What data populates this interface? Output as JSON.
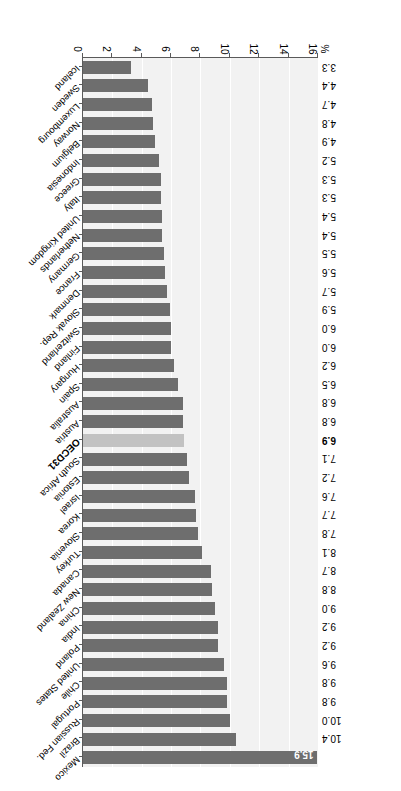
{
  "chart_data": {
    "type": "bar",
    "orientation": "vertical-bars-rotated",
    "title": "",
    "xlabel": "",
    "ylabel": "%",
    "unit_label": "%",
    "ylim": [
      0,
      16
    ],
    "tick_labels": [
      "0",
      "2",
      "4",
      "6",
      "8",
      "10",
      "12",
      "14",
      "16"
    ],
    "tick_values": [
      0,
      2,
      4,
      6,
      8,
      10,
      12,
      14,
      16
    ],
    "grid": true,
    "legend": "none",
    "highlight_category": "OECD31",
    "colors": {
      "bar": "#6e6e6e",
      "highlight_bar": "#c2c2c2",
      "plot_background": "#f2f2f2",
      "gridline": "#ffffff",
      "axis": "#5a5a5a",
      "text": "#000000"
    },
    "categories": [
      "Mexico",
      "Brazil",
      "Russian Fed.",
      "Portugal",
      "Chile",
      "United States",
      "Poland",
      "India",
      "China",
      "New Zealand",
      "Canada",
      "Turkey",
      "Slovenia",
      "Korea",
      "Israel",
      "Estonia",
      "South Africa",
      "OECD31",
      "Austria",
      "Australia",
      "Spain",
      "Hungary",
      "Finland",
      "Switzerland",
      "Slovak Rep.",
      "Denmark",
      "France",
      "Germany",
      "Netherlands",
      "United Kingdom",
      "Italy",
      "Greece",
      "Indonesia",
      "Belgium",
      "Norway",
      "Luxembourg",
      "Sweden",
      "Iceland"
    ],
    "values": [
      15.9,
      10.4,
      10.0,
      9.8,
      9.8,
      9.6,
      9.2,
      9.2,
      9.0,
      8.8,
      8.7,
      8.1,
      7.8,
      7.7,
      7.6,
      7.2,
      7.1,
      6.9,
      6.8,
      6.8,
      6.5,
      6.2,
      6.0,
      6.0,
      5.9,
      5.7,
      5.6,
      5.5,
      5.4,
      5.4,
      5.3,
      5.3,
      5.2,
      4.9,
      4.8,
      4.7,
      4.4,
      3.3
    ],
    "value_labels": [
      "15.9",
      "10.4",
      "10.0",
      "9.8",
      "9.8",
      "9.6",
      "9.2",
      "9.2",
      "9.0",
      "8.8",
      "8.7",
      "8.1",
      "7.8",
      "7.7",
      "7.6",
      "7.2",
      "7.1",
      "6.9",
      "6.8",
      "6.8",
      "6.5",
      "6.2",
      "6.0",
      "6.0",
      "5.9",
      "5.7",
      "5.6",
      "5.5",
      "5.4",
      "5.4",
      "5.3",
      "5.3",
      "5.2",
      "4.9",
      "4.8",
      "4.7",
      "4.4",
      "3.3"
    ]
  }
}
